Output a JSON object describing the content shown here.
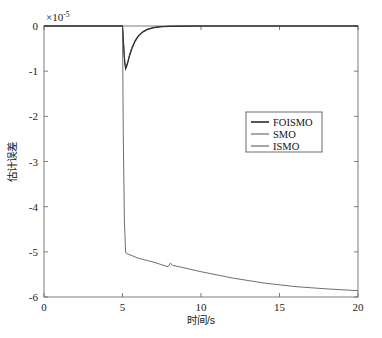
{
  "chart_data": {
    "type": "line",
    "title": "",
    "subtitle": "",
    "xlabel": "时间/s",
    "ylabel": "估计误差",
    "y_multiplier_text": "×10",
    "y_multiplier_exponent": "-5",
    "y_multiplier_value": 1e-05,
    "xlim": [
      0,
      20
    ],
    "ylim": [
      -6,
      0
    ],
    "xticks": [
      0,
      5,
      10,
      15,
      20
    ],
    "xticklabels": [
      "0",
      "5",
      "10",
      "15",
      "20"
    ],
    "yticks": [
      0,
      -1,
      -2,
      -3,
      -4,
      -5,
      -6
    ],
    "yticklabels": [
      "0",
      "-1",
      "-2",
      "-3",
      "-4",
      "-5",
      "-6"
    ],
    "grid": false,
    "legend_position": "center-right",
    "legend_entries": [
      "FOISMO",
      "SMO",
      "ISMO"
    ],
    "series": [
      {
        "name": "FOISMO",
        "color": "#1c1c1c",
        "x": [
          0,
          1,
          2,
          3,
          4,
          4.9,
          5.0,
          5.05,
          5.1,
          5.15,
          5.2,
          5.3,
          5.45,
          5.6,
          5.8,
          6.0,
          6.3,
          6.6,
          7.0,
          7.5,
          8,
          9,
          10,
          12,
          14,
          16,
          18,
          20
        ],
        "values": [
          0,
          0,
          0,
          0,
          0,
          0,
          0,
          -0.3,
          -0.62,
          -0.84,
          -0.95,
          -0.86,
          -0.66,
          -0.5,
          -0.34,
          -0.23,
          -0.13,
          -0.075,
          -0.035,
          -0.015,
          -0.007,
          -0.002,
          -0.001,
          0,
          0,
          0,
          0,
          0
        ]
      },
      {
        "name": "SMO",
        "color": "#3a3a3a",
        "x": [
          0,
          1,
          2,
          3,
          4,
          4.9,
          5.0,
          5.05,
          5.1,
          5.15,
          5.2,
          5.3,
          5.45,
          5.6,
          5.8,
          6.0,
          6.3,
          6.6,
          7.0,
          7.5,
          8,
          9,
          10,
          12,
          14,
          16,
          18,
          20
        ],
        "values": [
          0,
          0,
          0,
          0,
          0,
          0,
          0,
          -0.28,
          -0.58,
          -0.8,
          -0.92,
          -0.83,
          -0.63,
          -0.47,
          -0.32,
          -0.21,
          -0.12,
          -0.068,
          -0.03,
          -0.013,
          -0.006,
          -0.002,
          -0.001,
          0,
          0,
          0,
          0,
          0
        ]
      },
      {
        "name": "ISMO",
        "color": "#4a4a4a",
        "x": [
          0,
          1,
          2,
          3,
          4,
          4.9,
          5.0,
          5.05,
          5.12,
          5.2,
          5.35,
          6,
          7,
          7.9,
          8.05,
          8.2,
          9,
          10,
          12,
          14,
          16,
          18,
          20
        ],
        "values": [
          0,
          0,
          0,
          0,
          0,
          0,
          0,
          -2.4,
          -4.3,
          -5.02,
          -5.05,
          -5.14,
          -5.23,
          -5.33,
          -5.25,
          -5.3,
          -5.36,
          -5.44,
          -5.58,
          -5.69,
          -5.77,
          -5.82,
          -5.86
        ]
      }
    ]
  }
}
